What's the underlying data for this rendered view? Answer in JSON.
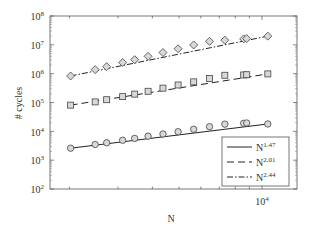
{
  "chart_data": {
    "type": "scatter",
    "title": "",
    "xlabel": "N",
    "ylabel": "# cycles",
    "xscale": "log",
    "yscale": "log",
    "xlim": [
      1700,
      13400
    ],
    "ylim": [
      100,
      100000000
    ],
    "x_tick_labels": [
      "10^4"
    ],
    "y_tick_labels": [
      "10^2",
      "10^3",
      "10^4",
      "10^5",
      "10^6",
      "10^7",
      "10^8"
    ],
    "grid": false,
    "legend_position": "lower right",
    "x": [
      2020,
      2480,
      2730,
      3120,
      3450,
      3860,
      4370,
      4960,
      5650,
      6450,
      7330,
      8580,
      8800,
      10500
    ],
    "series": [
      {
        "name": "N^1.47",
        "marker": "circle",
        "line": "solid",
        "values": [
          2600,
          3500,
          4000,
          4900,
          5700,
          6800,
          8100,
          9700,
          11800,
          14500,
          17700,
          19000,
          19500,
          18000
        ]
      },
      {
        "name": "N^2.01",
        "marker": "square",
        "line": "dashed",
        "values": [
          81000,
          105000,
          125000,
          160000,
          195000,
          245000,
          315000,
          405000,
          520000,
          680000,
          880000,
          900000,
          920000,
          980000
        ]
      },
      {
        "name": "N^2.44",
        "marker": "diamond",
        "line": "dashdot",
        "values": [
          830000,
          1380000,
          1750000,
          2430000,
          3050000,
          4000000,
          5400000,
          7300000,
          9900000,
          13200000,
          14500000,
          16000000,
          16500000,
          20000000
        ]
      }
    ]
  },
  "axes": {
    "xlabel": "N",
    "ylabel": "# cycles",
    "y_ticks": [
      {
        "base": "10",
        "exp": "8"
      },
      {
        "base": "10",
        "exp": "7"
      },
      {
        "base": "10",
        "exp": "6"
      },
      {
        "base": "10",
        "exp": "5"
      },
      {
        "base": "10",
        "exp": "4"
      },
      {
        "base": "10",
        "exp": "3"
      },
      {
        "base": "10",
        "exp": "2"
      }
    ],
    "x_tick": {
      "base": "10",
      "exp": "4"
    }
  },
  "legend": [
    {
      "base": "N",
      "exp": "1.47",
      "style": "solid"
    },
    {
      "base": "N",
      "exp": "2.01",
      "style": "dashed"
    },
    {
      "base": "N",
      "exp": "2.44",
      "style": "dashdot"
    }
  ]
}
